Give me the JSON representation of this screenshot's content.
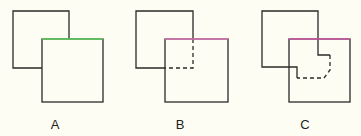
{
  "panels": [
    {
      "label": "A",
      "highlight_color": "#5fd35f"
    },
    {
      "label": "B",
      "highlight_color": "#e07ab8"
    },
    {
      "label": "C",
      "highlight_color": "#d05aa8"
    }
  ],
  "colors": {
    "stroke": "#2a2a2a",
    "background": "#fdfdf3"
  }
}
